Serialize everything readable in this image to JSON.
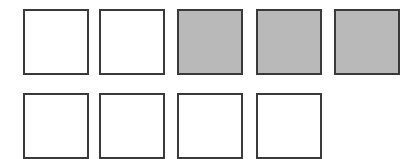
{
  "grid": {
    "rows": [
      {
        "cells": [
          {
            "filled": false
          },
          {
            "filled": false
          },
          {
            "filled": true
          },
          {
            "filled": true
          },
          {
            "filled": true
          }
        ]
      },
      {
        "cells": [
          {
            "filled": false
          },
          {
            "filled": false
          },
          {
            "filled": false
          },
          {
            "filled": false
          }
        ]
      }
    ],
    "filled_count": 3,
    "total_count": 9
  },
  "colors": {
    "filled": "#b9b9b9",
    "empty": "#ffffff",
    "border": "#3a3a3a"
  }
}
